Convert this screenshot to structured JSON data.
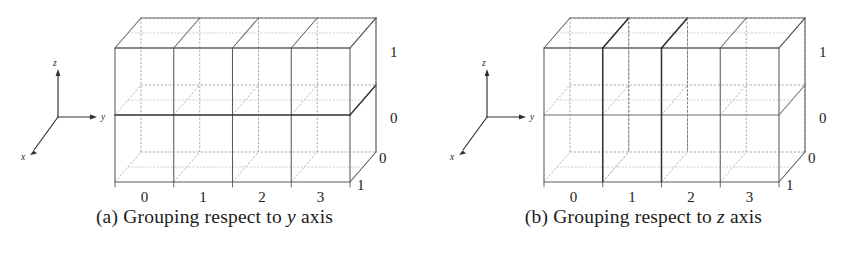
{
  "figure": {
    "type": "two-panel-3d-grid-diagram",
    "style": "academic line drawing, oblique projection, dotted hidden edges"
  },
  "panels": [
    {
      "id": "a",
      "caption_prefix": "(a)",
      "caption_text": "Grouping respect to",
      "caption_italic": "y",
      "caption_suffix": "axis",
      "caption_full": "(a) Grouping respect to y axis",
      "grouping_axis": "y",
      "axes": {
        "x_label": "x",
        "y_label": "y",
        "z_label": "z"
      },
      "grid": {
        "cells_y": 4,
        "cells_z": 2,
        "cells_x": 2
      },
      "ticks": {
        "bottom": [
          "0",
          "1",
          "2",
          "3"
        ],
        "right_z": [
          "1",
          "0"
        ],
        "right_x": [
          "0",
          "1"
        ]
      },
      "emphasis": "horizontal slabs along y axis"
    },
    {
      "id": "b",
      "caption_prefix": "(b)",
      "caption_text": "Grouping respect to",
      "caption_italic": "z",
      "caption_suffix": "axis",
      "caption_full": "(b) Grouping respect to z axis",
      "grouping_axis": "z",
      "axes": {
        "x_label": "x",
        "y_label": "y",
        "z_label": "z"
      },
      "grid": {
        "cells_y": 4,
        "cells_z": 2,
        "cells_x": 2
      },
      "ticks": {
        "bottom": [
          "0",
          "1",
          "2",
          "3"
        ],
        "right_z": [
          "1",
          "0"
        ],
        "right_x": [
          "0",
          "1"
        ]
      },
      "emphasis": "vertical columns along z axis"
    }
  ],
  "colors": {
    "ink": "#1b1b1b",
    "solid_edge": "#555555",
    "bold_edge": "#3a3a3a",
    "hidden_edge": "#9a9a9a",
    "faint_edge": "#bcbcbc",
    "background": "#ffffff"
  }
}
